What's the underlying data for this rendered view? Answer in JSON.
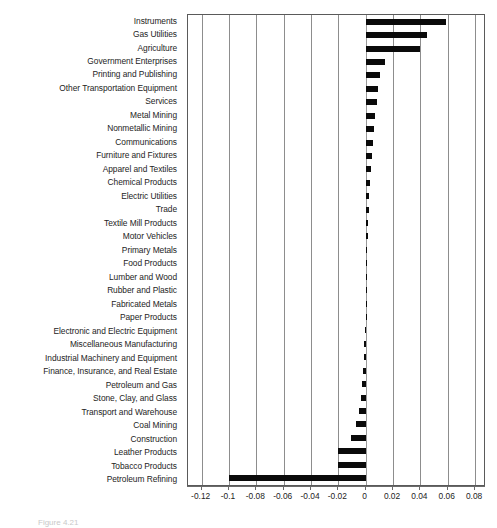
{
  "figure": {
    "caption": "Figure 4.21"
  },
  "chart_data": {
    "type": "bar",
    "orientation": "horizontal",
    "title": "",
    "xlabel": "",
    "ylabel": "",
    "xlim": [
      -0.13,
      0.088
    ],
    "grid": true,
    "legend": "none",
    "bar_color": "#0a0a0a",
    "xticks": [
      -0.12,
      -0.1,
      -0.08,
      -0.06,
      -0.04,
      -0.02,
      0,
      0.02,
      0.04,
      0.06,
      0.08
    ],
    "xtick_labels": [
      "-0.12",
      "-0.1",
      "-0.08",
      "-0.06",
      "-0.04",
      "-0.02",
      "0",
      "0.02",
      "0.04",
      "0.06",
      "0.08"
    ],
    "categories": [
      "Instruments",
      "Gas Utilities",
      "Agriculture",
      "Government Enterprises",
      "Printing and Publishing",
      "Other Transportation Equipment",
      "Services",
      "Metal Mining",
      "Nonmetallic Mining",
      "Communications",
      "Furniture and Fixtures",
      "Apparel and Textiles",
      "Chemical Products",
      "Electric Utilities",
      "Trade",
      "Textile Mill Products",
      "Motor Vehicles",
      "Primary Metals",
      "Food Products",
      "Lumber and Wood",
      "Rubber and Plastic",
      "Fabricated Metals",
      "Paper Products",
      "Electronic and Electric Equipment",
      "Miscellaneous Manufacturing",
      "Industrial Machinery and Equipment",
      "Finance, Insurance, and Real Estate",
      "Petroleum and Gas",
      "Stone, Clay, and Glass",
      "Transport and Warehouse",
      "Coal Mining",
      "Construction",
      "Leather Products",
      "Tobacco Products",
      "Petroleum Refining"
    ],
    "values": [
      0.059,
      0.045,
      0.04,
      0.014,
      0.0105,
      0.009,
      0.008,
      0.0068,
      0.0058,
      0.005,
      0.0044,
      0.0038,
      0.0032,
      0.0027,
      0.0022,
      0.0018,
      0.0014,
      0.0011,
      0.0008,
      0.0005,
      0.0003,
      0.0001,
      0.0,
      -0.0004,
      -0.0009,
      -0.0014,
      -0.002,
      -0.0028,
      -0.0038,
      -0.0052,
      -0.0072,
      -0.0105,
      -0.02,
      -0.0205,
      -0.1
    ]
  }
}
